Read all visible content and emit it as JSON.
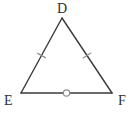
{
  "figure": {
    "name": "triangle-def",
    "type": "geometry-diagram",
    "shape": "triangle",
    "background_color": "#ffffff",
    "stroke_color": "#3a3a3a",
    "tick_color": "#8f8f8f",
    "label_color": "#2f2f2f",
    "stroke_width": 1.4,
    "canvas": {
      "width": 133,
      "height": 113
    }
  },
  "vertices": [
    {
      "id": "D",
      "label": "D",
      "x": 62,
      "y": 18,
      "label_x": 57,
      "label_y": 2
    },
    {
      "id": "E",
      "label": "E",
      "x": 21,
      "y": 93,
      "label_x": 4,
      "label_y": 94
    },
    {
      "id": "F",
      "label": "F",
      "x": 112,
      "y": 93,
      "label_x": 118,
      "label_y": 94
    }
  ],
  "sides": [
    {
      "id": "DE",
      "name": "side-de",
      "from": "D",
      "to": "E",
      "mark": "single-tick",
      "mark_count": 1,
      "mark_x": 41.5,
      "mark_y": 55.5
    },
    {
      "id": "DF",
      "name": "side-df",
      "from": "D",
      "to": "F",
      "mark": "single-tick",
      "mark_count": 1,
      "mark_x": 87,
      "mark_y": 55.5
    },
    {
      "id": "EF",
      "name": "side-ef",
      "from": "E",
      "to": "F",
      "mark": "circle",
      "mark_count": 1,
      "mark_x": 66.5,
      "mark_y": 93,
      "mark_radius": 3.2
    }
  ],
  "labels": {
    "d": "D",
    "e": "E",
    "f": "F"
  }
}
